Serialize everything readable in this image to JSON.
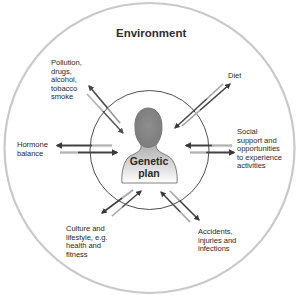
{
  "diagram": {
    "title": "Environment",
    "center": {
      "line1": "Genetic",
      "line2": "plan",
      "icon": "person-silhouette-icon"
    },
    "factors": [
      {
        "id": "pollution",
        "text": "Pollution,\ndrugs,\nalcohol,\ntobacco\nsmoke",
        "position": "top-left"
      },
      {
        "id": "diet",
        "text": "Diet",
        "position": "top-right"
      },
      {
        "id": "hormone",
        "text": "Hormone\nbalance",
        "position": "left"
      },
      {
        "id": "social",
        "text": "Social\nsupport and\nopportunities\nto experience\nactivities",
        "position": "right"
      },
      {
        "id": "culture",
        "text": "Culture and\nlifestyle, e.g.\nhealth and\nfitness",
        "position": "bottom-left"
      },
      {
        "id": "accidents",
        "text": "Accidents,\ninjuries and\ninfections",
        "position": "bottom-right"
      }
    ],
    "arrow_style": "bidirectional double arrows (inward and outward) with gradient fade",
    "colors": {
      "outer_ring": "#c8c8c8",
      "inner_ring": "#333333",
      "arrow": "#4a4a4a",
      "silhouette": "#8c8c8c",
      "text": "#2a2a2a"
    }
  }
}
